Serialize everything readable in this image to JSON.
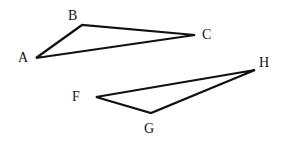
{
  "diagram": {
    "triangles": [
      {
        "name": "ABC",
        "vertices": [
          {
            "label": "A",
            "x": 36,
            "y": 58,
            "lx": 18,
            "ly": 62
          },
          {
            "label": "B",
            "x": 82,
            "y": 25,
            "lx": 68,
            "ly": 20
          },
          {
            "label": "C",
            "x": 195,
            "y": 35,
            "lx": 202,
            "ly": 39
          }
        ]
      },
      {
        "name": "FGH",
        "vertices": [
          {
            "label": "F",
            "x": 96,
            "y": 97,
            "lx": 72,
            "ly": 101
          },
          {
            "label": "G",
            "x": 151,
            "y": 113,
            "lx": 144,
            "ly": 133
          },
          {
            "label": "H",
            "x": 255,
            "y": 70,
            "lx": 259,
            "ly": 67
          }
        ]
      }
    ],
    "labels": {
      "A": "A",
      "B": "B",
      "C": "C",
      "F": "F",
      "G": "G",
      "H": "H"
    }
  }
}
